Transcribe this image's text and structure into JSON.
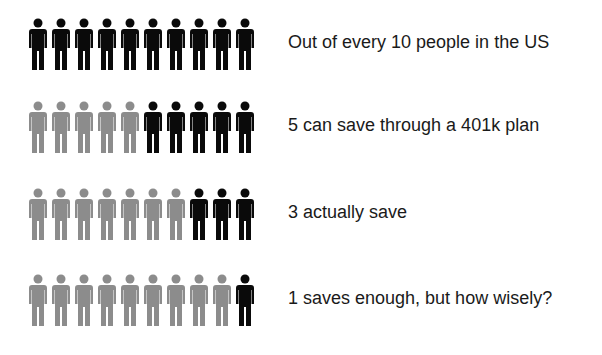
{
  "colors": {
    "dark": "#0a0a0a",
    "light": "#8c8c8c"
  },
  "rows": [
    {
      "label": "Out of every 10 people in the US",
      "total": 10,
      "highlighted": 10
    },
    {
      "label": "5 can save through a 401k plan",
      "total": 10,
      "highlighted": 5
    },
    {
      "label": "3 actually save",
      "total": 10,
      "highlighted": 3
    },
    {
      "label": "1 saves enough, but how wisely?",
      "total": 10,
      "highlighted": 1
    }
  ]
}
